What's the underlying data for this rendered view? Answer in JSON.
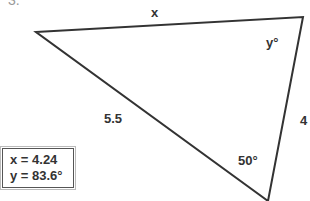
{
  "question": {
    "number": "3."
  },
  "triangle": {
    "vertices": {
      "left": [
        36,
        32
      ],
      "top_right": [
        303,
        17
      ],
      "bottom": [
        268,
        201
      ]
    },
    "stroke_color": "#333333",
    "sides": {
      "top": "x",
      "left": "5.5",
      "right": "4"
    },
    "angles": {
      "top_right": "y°",
      "bottom": "50°"
    }
  },
  "answer": {
    "x_line": "x = 4.24",
    "y_line": "y = 83.6°"
  }
}
